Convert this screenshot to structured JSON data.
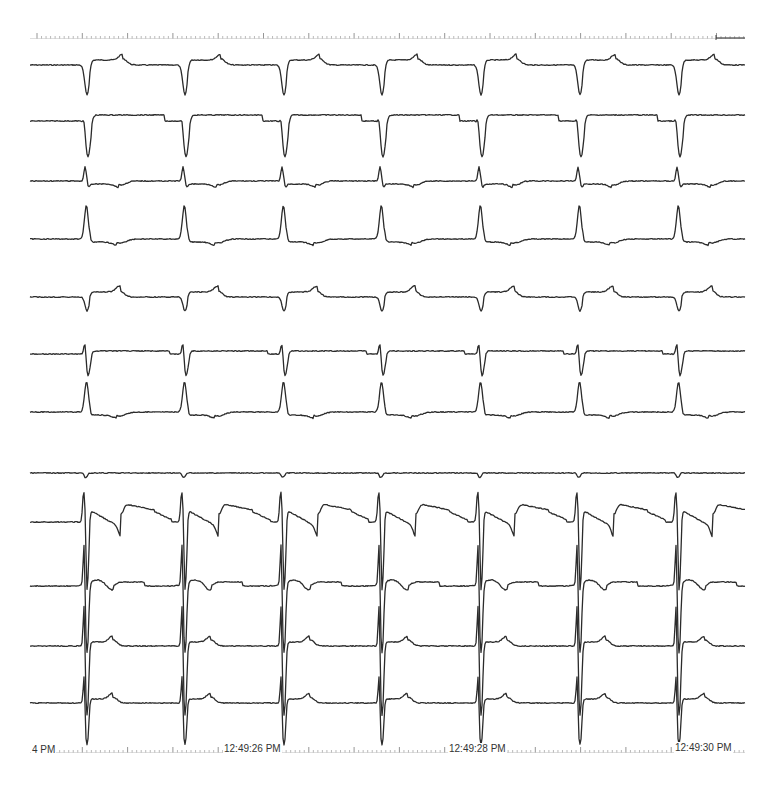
{
  "chart_data": {
    "type": "line",
    "title": "",
    "subtitle": "Multichannel ECG / intracardiac electrogram strip (12 channels)",
    "xlabel": "Time",
    "ylabel": "",
    "grid": false,
    "legend": "none",
    "x_axis": {
      "tick_labels": [
        "4 PM",
        "12:49:26 PM",
        "12:49:28 PM",
        "12:49:30 PM"
      ],
      "tick_label_x_px": [
        33,
        225,
        450,
        675
      ],
      "major_tick_spacing_px": 45.3,
      "minor_ticks_per_major": 10
    },
    "scale_bar": {
      "x1": 716,
      "x2": 745,
      "y": 38
    },
    "strip": {
      "x_start": 30,
      "x_end": 745,
      "ruler_top_y": 38,
      "ruler_bottom_y": 752
    },
    "beat_x_px": [
      85,
      183,
      282,
      380,
      479,
      578,
      677
    ],
    "rr_interval_px": 98.7,
    "series": [
      {
        "name": "Channel 1",
        "baseline_y": 65,
        "morphology": "deep-negative QRS, small positive T",
        "qrs_amp": -30,
        "t_amp": 6
      },
      {
        "name": "Channel 2",
        "baseline_y": 121,
        "morphology": "small r then deep S, flat T",
        "qrs_amp": -36,
        "t_amp": 2
      },
      {
        "name": "Channel 3",
        "baseline_y": 181,
        "morphology": "narrow positive spike, shallow neg T",
        "qrs_amp": 14,
        "t_amp": -4
      },
      {
        "name": "Channel 4",
        "baseline_y": 239,
        "morphology": "tall positive R, neg T",
        "qrs_amp": 34,
        "t_amp": -4
      },
      {
        "name": "Channel 5",
        "baseline_y": 297,
        "morphology": "small negative QRS, positive T",
        "qrs_amp": -14,
        "t_amp": 6
      },
      {
        "name": "Channel 6",
        "baseline_y": 354,
        "morphology": "biphasic RS, flat",
        "qrs_amp": -22,
        "t_amp": 2
      },
      {
        "name": "Channel 7",
        "baseline_y": 412,
        "morphology": "tall positive R, neg T",
        "qrs_amp": 30,
        "t_amp": -4
      },
      {
        "name": "Channel 8",
        "baseline_y": 473,
        "morphology": "near-isoelectric, tiny deflection",
        "qrs_amp": -4,
        "t_amp": 0
      },
      {
        "name": "Channel 9",
        "baseline_y": 522,
        "morphology": "large spike, fractionated, ST wave",
        "qrs_amp": -70,
        "t_amp": 16
      },
      {
        "name": "Channel 10",
        "baseline_y": 586,
        "morphology": "large fractionated spike, biphasic T",
        "qrs_amp": -70,
        "t_amp": 6
      },
      {
        "name": "Channel 11",
        "baseline_y": 646,
        "morphology": "large fractionated spike, positive T",
        "qrs_amp": -70,
        "t_amp": 6
      },
      {
        "name": "Channel 12",
        "baseline_y": 703,
        "morphology": "large fractionated spike, positive T",
        "qrs_amp": -42,
        "t_amp": 6
      }
    ]
  },
  "axis_labels": {
    "t0": "4 PM",
    "t1": "12:49:26 PM",
    "t2": "12:49:28 PM",
    "t3": "12:49:30 PM"
  },
  "colors": {
    "trace": "#2b2b2b",
    "ruler": "#8a8a8a",
    "background": "#ffffff",
    "label": "#333333"
  }
}
